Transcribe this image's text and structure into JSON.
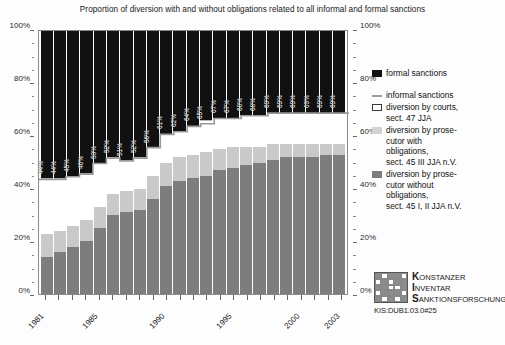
{
  "chart_data": {
    "type": "bar",
    "title": "Proportion of diversion with and without obligations related to all informal and formal sanctions",
    "xlabel": "",
    "ylabel": "",
    "ylim": [
      0,
      100
    ],
    "ytick_labels": [
      "0%",
      "20%",
      "40%",
      "60%",
      "80%",
      "100%"
    ],
    "ytick_values": [
      0,
      20,
      40,
      60,
      80,
      100
    ],
    "grid": false,
    "stacked": true,
    "legend_position": "right",
    "categories": [
      "1981",
      "1982",
      "1983",
      "1984",
      "1985",
      "1986",
      "1987",
      "1988",
      "1989",
      "1990",
      "1991",
      "1992",
      "1993",
      "1994",
      "1995",
      "1996",
      "1997",
      "1998",
      "1999",
      "2000",
      "2001",
      "2002",
      "2003"
    ],
    "xtick_labels_shown": [
      "1981",
      "1985",
      "1990",
      "1995",
      "2000",
      "2003"
    ],
    "series": [
      {
        "name": "diversion by prosecutor without obligations, sect. 45 I, II JJA n.V.",
        "color": "#7d7d7d",
        "values": [
          14,
          16,
          18,
          20,
          25,
          30,
          31,
          32,
          36,
          41,
          43,
          44,
          45,
          47,
          48,
          49,
          50,
          51,
          52,
          52,
          52,
          53,
          53
        ]
      },
      {
        "name": "diversion by prosecutor with obligations, sect. 45 III JJA n.V.",
        "color": "#c9c9c9",
        "values": [
          9,
          8,
          8,
          8,
          8,
          8,
          8,
          8,
          9,
          9,
          9,
          9,
          9,
          8,
          8,
          7,
          6,
          6,
          5,
          5,
          5,
          4,
          4
        ]
      },
      {
        "name": "diversion by courts, sect. 47 JJA",
        "color": "#ffffff",
        "values": [
          21,
          20,
          19,
          18,
          17,
          14,
          12,
          12,
          11,
          11,
          10,
          11,
          12,
          12,
          11,
          12,
          12,
          12,
          12,
          12,
          12,
          12,
          12
        ]
      },
      {
        "name": "formal sanctions",
        "color": "#111111",
        "values": [
          56,
          56,
          55,
          54,
          50,
          48,
          49,
          48,
          44,
          39,
          38,
          36,
          34,
          33,
          33,
          32,
          32,
          31,
          31,
          31,
          31,
          31,
          31
        ]
      }
    ],
    "informal_sanctions_line": {
      "name": "informal sanctions",
      "color": "#9a9a9a",
      "description": "cumulative top of the three diversion segments",
      "values": [
        44,
        44,
        45,
        46,
        50,
        52,
        51,
        52,
        56,
        61,
        62,
        64,
        65,
        67,
        67,
        68,
        68,
        69,
        69,
        69,
        69,
        69,
        69
      ]
    },
    "bar_labels": [
      "44%",
      "44%",
      "45%",
      "46%",
      "50%",
      "52%",
      "51%",
      "52%",
      "56%",
      "61%",
      "62%",
      "64%",
      "65%",
      "67%",
      "67%",
      "68%",
      "68%",
      "69%",
      "69%",
      "69%",
      "69%",
      "69%",
      "69%"
    ]
  },
  "legend": {
    "items": [
      {
        "label": "formal sanctions",
        "swatch": "black-square"
      },
      {
        "label": "informal sanctions",
        "swatch": "gray-line"
      },
      {
        "label": "diversion by courts,\nsect. 47 JJA",
        "line1": "diversion by courts,",
        "line2": "sect. 47 JJA",
        "swatch": "white-square"
      },
      {
        "line1": "diversion by prose-",
        "line2": "cutor with",
        "line3": "obligations,",
        "line4": "sect. 45 III JJA n.V.",
        "swatch": "light-gray-square"
      },
      {
        "line1": "diversion by prose-",
        "line2": "cutor without",
        "line3": "obligations,",
        "line4": "sect. 45 I, II JJA n.V.",
        "swatch": "medium-gray-square"
      }
    ]
  },
  "logo": {
    "line1_cap": "K",
    "line1_rest": "ONSTANZER",
    "line2_cap": "I",
    "line2_rest": "NVENTAR",
    "line3_cap": "S",
    "line3_rest": "ANKTIONSFORSCHUNG",
    "code": "KIS:DUB1.03.0#25"
  }
}
